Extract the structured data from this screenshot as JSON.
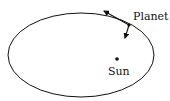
{
  "diagram": {
    "labels": {
      "planet": "Planet",
      "sun": "Sun"
    },
    "colors": {
      "stroke": "#111111",
      "background": "#ffffff"
    }
  }
}
